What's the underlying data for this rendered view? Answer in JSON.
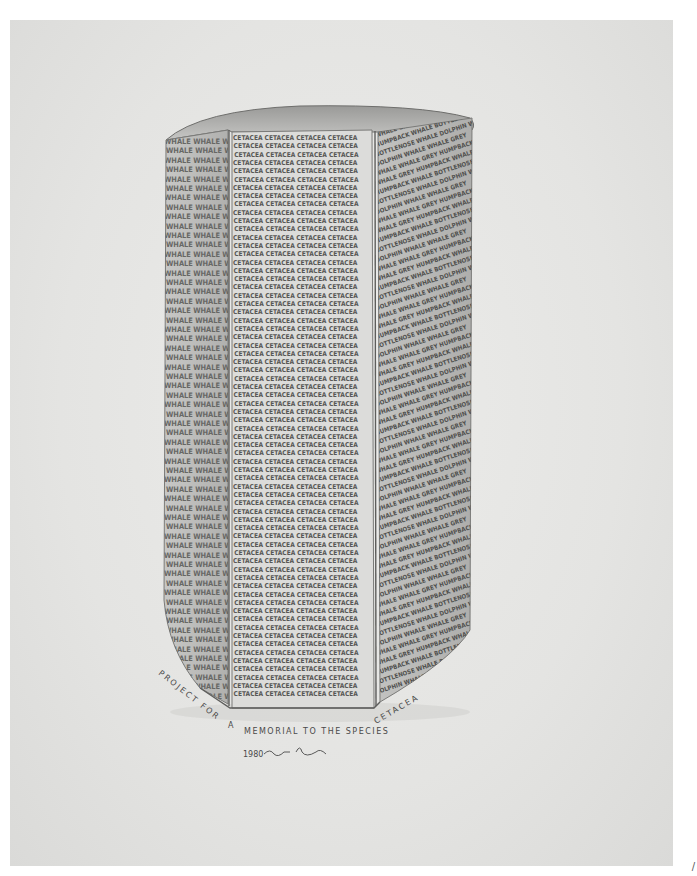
{
  "artwork": {
    "medium": "pencil drawing",
    "subject": "hexagonal column memorial inscribed with whale names",
    "faces": {
      "front": {
        "word": "CETACEA",
        "repeat_per_line": 4,
        "lines": 68
      },
      "left": {
        "word": "WHALE",
        "repeat_per_line": 3,
        "lines": 60
      },
      "right": {
        "words": [
          "WHALE",
          "WHALE GREY",
          "HUMPBACK WHALE",
          "BOTTLENOSE WHALE",
          "DOLPHIN"
        ],
        "lines": 60
      }
    },
    "captions": {
      "left_diagonal": "PROJECT FOR",
      "center": "A",
      "main": "MEMORIAL TO THE SPECIES",
      "right_diagonal": "CETACEA",
      "date": "1980",
      "signature": "Haim Steinbach"
    },
    "colors": {
      "paper": "#e6e6e4",
      "graphite_dark": "#3c3c3c",
      "graphite_mid": "#8a8a8a",
      "graphite_light": "#bdbdbb"
    }
  }
}
